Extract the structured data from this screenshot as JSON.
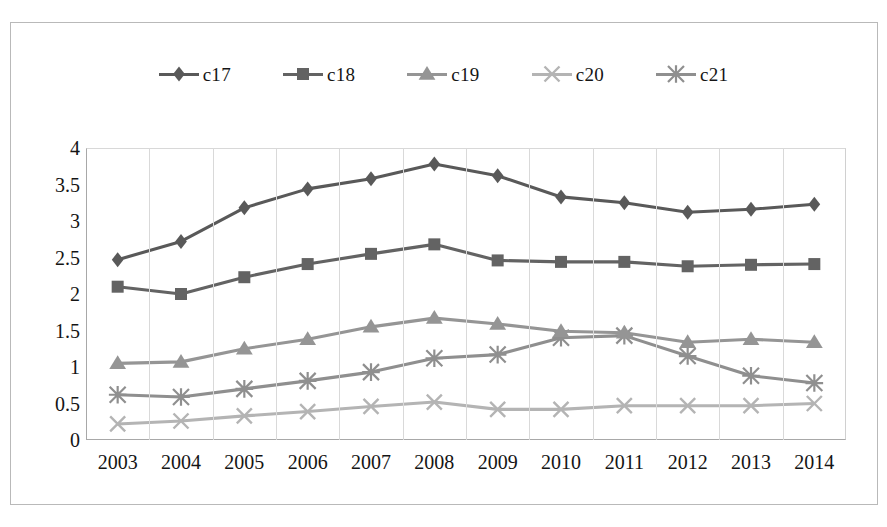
{
  "chart_data": {
    "type": "line",
    "title": "",
    "xlabel": "",
    "ylabel": "",
    "categories": [
      "2003",
      "2004",
      "2005",
      "2006",
      "2007",
      "2008",
      "2009",
      "2010",
      "2011",
      "2012",
      "2013",
      "2014"
    ],
    "ylim": [
      0,
      4
    ],
    "yticks": [
      "0",
      "0.5",
      "1",
      "1.5",
      "2",
      "2.5",
      "3",
      "3.5",
      "4"
    ],
    "ytick_values": [
      0,
      0.5,
      1,
      1.5,
      2,
      2.5,
      3,
      3.5,
      4
    ],
    "grid": "vertical",
    "legend_position": "top",
    "series": [
      {
        "name": "c17",
        "marker": "diamond",
        "color": "#595959",
        "values": [
          2.47,
          2.72,
          3.18,
          3.44,
          3.58,
          3.78,
          3.62,
          3.33,
          3.25,
          3.12,
          3.16,
          3.23
        ]
      },
      {
        "name": "c18",
        "marker": "square",
        "color": "#636363",
        "values": [
          2.1,
          2.0,
          2.23,
          2.41,
          2.55,
          2.68,
          2.46,
          2.44,
          2.44,
          2.38,
          2.4,
          2.41
        ]
      },
      {
        "name": "c19",
        "marker": "triangle",
        "color": "#959595",
        "values": [
          1.05,
          1.07,
          1.25,
          1.38,
          1.55,
          1.67,
          1.59,
          1.49,
          1.47,
          1.34,
          1.38,
          1.34
        ]
      },
      {
        "name": "c20",
        "marker": "x",
        "color": "#b4b4b4",
        "values": [
          0.22,
          0.26,
          0.33,
          0.39,
          0.46,
          0.52,
          0.42,
          0.42,
          0.47,
          0.47,
          0.47,
          0.5
        ]
      },
      {
        "name": "c21",
        "marker": "asterisk",
        "color": "#8f8f8f",
        "values": [
          0.62,
          0.59,
          0.7,
          0.81,
          0.93,
          1.12,
          1.17,
          1.4,
          1.43,
          1.15,
          0.88,
          0.78
        ]
      }
    ]
  },
  "legend": {
    "items": [
      {
        "label": "c17"
      },
      {
        "label": "c18"
      },
      {
        "label": "c19"
      },
      {
        "label": "c20"
      },
      {
        "label": "c21"
      }
    ]
  }
}
